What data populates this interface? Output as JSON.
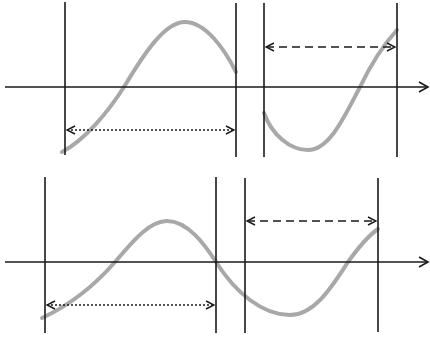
{
  "diagram": {
    "colors": {
      "line": "#1a1a1a",
      "curve": "#a8a8a8",
      "background": "#ffffff"
    },
    "panels": [
      {
        "id": "top",
        "axis": {
          "y": 87,
          "x1": 5,
          "x2": 428
        },
        "verticals": [
          {
            "x": 65,
            "y1": 2,
            "y2": 155
          },
          {
            "x": 236,
            "y1": 3,
            "y2": 157
          },
          {
            "x": 264,
            "y1": 3,
            "y2": 157
          },
          {
            "x": 397,
            "y1": 3,
            "y2": 157
          }
        ],
        "dotted_arrow": {
          "y": 130,
          "x1": 67,
          "x2": 234
        },
        "dashed_arrow": {
          "y": 47,
          "x1": 266,
          "x2": 395
        },
        "curve_left": "M62,152 C85,140 108,112 124,87 C145,52 165,22 185,22 C205,22 224,48 236,72",
        "curve_right": "M264,113 C272,135 290,150 308,150 C330,150 345,115 360,87 C372,62 386,42 397,30"
      },
      {
        "id": "bottom",
        "axis": {
          "y": 262,
          "x1": 5,
          "x2": 428
        },
        "verticals": [
          {
            "x": 45,
            "y1": 177,
            "y2": 333
          },
          {
            "x": 216,
            "y1": 177,
            "y2": 333
          },
          {
            "x": 245,
            "y1": 178,
            "y2": 333
          },
          {
            "x": 378,
            "y1": 178,
            "y2": 332
          }
        ],
        "dotted_arrow": {
          "y": 305,
          "x1": 47,
          "x2": 214
        },
        "dashed_arrow": {
          "y": 221,
          "x1": 247,
          "x2": 376
        },
        "curve": "M42,318 C70,305 95,285 115,262 C130,245 148,221 167,221 C188,221 205,245 216,262 C235,292 262,315 290,315 C315,315 333,285 348,262 C358,248 368,236 378,229"
      }
    ]
  }
}
